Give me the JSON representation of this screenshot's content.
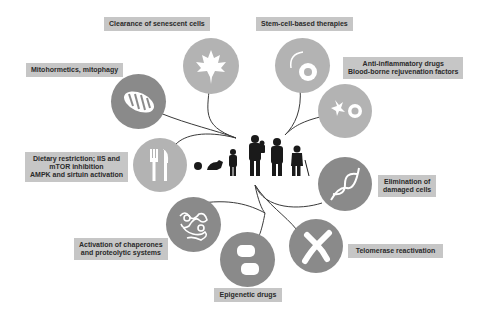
{
  "diagram": {
    "center": {
      "description": "life-course silhouettes",
      "stages": [
        "embryo",
        "crawling-baby",
        "child",
        "adult-with-child",
        "adult",
        "elderly-with-cane"
      ]
    },
    "interventions": [
      {
        "id": "senescent",
        "label": "Clearance of senescent cells",
        "icon": "maple-leaf-icon"
      },
      {
        "id": "mito",
        "label": "Mitohormetics, mitophagy",
        "icon": "mitochondrion-icon"
      },
      {
        "id": "dietary",
        "label_lines": [
          "Dietary restriction; IIS and",
          "mTOR inhibition",
          "AMPK and sirtuin activation"
        ],
        "icon": "fork-knife-icon"
      },
      {
        "id": "chaperones",
        "label_lines": [
          "Activation of chaperones",
          "and proteolytic systems"
        ],
        "icon": "protein-structure-icon"
      },
      {
        "id": "epigenetic",
        "label": "Epigenetic drugs",
        "icon": "pills-icon"
      },
      {
        "id": "telomerase",
        "label": "Telomerase reactivation",
        "icon": "chromosome-icon"
      },
      {
        "id": "elimination",
        "label_lines": [
          "Elimination of",
          "damaged cells"
        ],
        "icon": "dna-helix-icon"
      },
      {
        "id": "antiinflam",
        "label_lines": [
          "Anti-inflammatory drugs",
          "Blood-borne rejuvenation factors"
        ],
        "icon": "cell-signaling-icon"
      },
      {
        "id": "stemcell",
        "label": "Stem-cell-based therapies",
        "icon": "stem-cell-icon"
      }
    ]
  },
  "colors": {
    "label_bg": "#c6c6c6",
    "circle_light": "#b3b3b3",
    "circle_dark": "#8a8a8a",
    "connector": "#3a3a3a",
    "silhouette": "#1a1a1a"
  }
}
